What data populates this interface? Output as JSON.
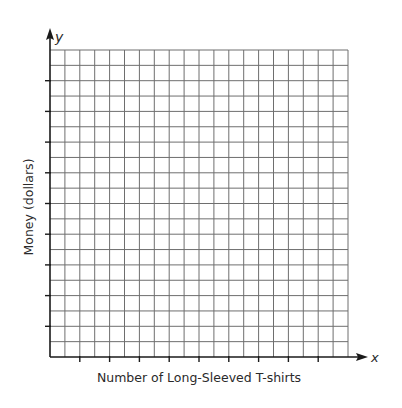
{
  "chart_data": {
    "type": "scatter",
    "title": "",
    "xlabel": "Number of Long-Sleeved T-shirts",
    "ylabel": "Money (dollars)",
    "x_axis_symbol": "x",
    "y_axis_symbol": "y",
    "grid": true,
    "grid_columns": 20,
    "grid_rows": 20,
    "x_tick_every_n_lines": 2,
    "y_tick_every_n_lines": 2,
    "x_tick_labels": [],
    "y_tick_labels": [],
    "series": [],
    "legend": null
  },
  "colors": {
    "grid": "#6e6e6e",
    "axis": "#1a1a1a",
    "text": "#2a2a2a"
  }
}
